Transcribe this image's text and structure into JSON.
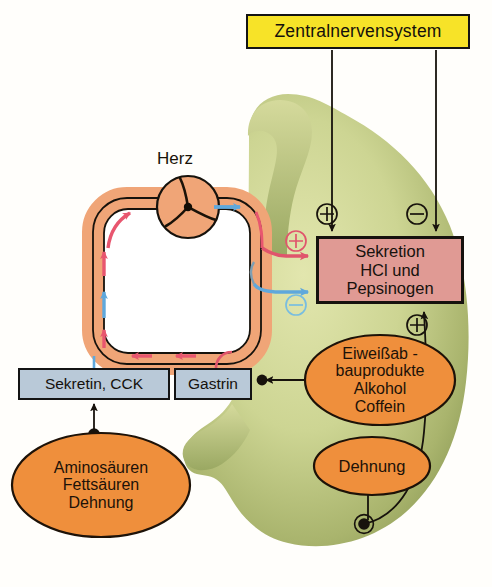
{
  "diagram": {
    "background_color": "#fffefb"
  },
  "cns_box": {
    "label": "Zentralnervensystem",
    "fill": "#f7e328",
    "border": "#141414"
  },
  "secretion_box": {
    "line1": "Sekretion",
    "line2": "HCl und",
    "line3": "Pepsinogen",
    "fill": "#e09a94",
    "border": "#16120e"
  },
  "hormone_boxes": [
    {
      "id": "sekretin",
      "label": "Sekretin, CCK",
      "fill": "#b9c9d8"
    },
    {
      "id": "gastrin",
      "label": "Gastrin",
      "fill": "#b9c9d8"
    }
  ],
  "stimulus_ellipses": [
    {
      "id": "aminosaeuren",
      "lines": [
        "Aminosäuren",
        "Fettsäuren",
        "Dehnung"
      ],
      "fill": "#ef8f3c"
    },
    {
      "id": "eiweissabbau",
      "lines": [
        "Eiweißab -",
        "bauprodukte",
        "Alkohol",
        "Coffein"
      ],
      "fill": "#ef8f3c"
    },
    {
      "id": "dehnung",
      "lines": [
        "Dehnung"
      ],
      "fill": "#ef8f3c"
    }
  ],
  "heart": {
    "label": "Herz",
    "fill": "#f0a577",
    "symbol": "pump-impeller"
  },
  "circulation": {
    "vessel_fill": "#f0a577",
    "arterial_arrow_color": "#e8566f",
    "venous_arrow_color": "#5fa8dc"
  },
  "signs": [
    {
      "id": "cns-excitatory",
      "glyph": "⊕",
      "color": "#14100c"
    },
    {
      "id": "cns-inhibitory",
      "glyph": "⊖",
      "color": "#14100c"
    },
    {
      "id": "gastrin-excitatory",
      "glyph": "⊕",
      "color": "#e0556c"
    },
    {
      "id": "sekretin-inhibitory",
      "glyph": "⊖",
      "color": "#5fa8dc"
    },
    {
      "id": "local-excitatory",
      "glyph": "⊕",
      "color": "#14100c"
    }
  ],
  "stomach": {
    "name": "stomach-organ",
    "fill_light": "#d8dd9c",
    "fill_dark": "#8fa05a"
  }
}
